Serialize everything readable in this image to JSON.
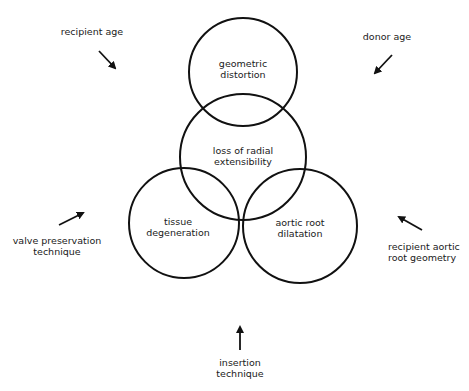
{
  "circles": {
    "top": {
      "line1": "geometric",
      "line2": "distortion"
    },
    "middle": {
      "line1": "loss of radial",
      "line2": "extensibility"
    },
    "left": {
      "line1": "tissue",
      "line2": "degeneration"
    },
    "right": {
      "line1": "aortic root",
      "line2": "dilatation"
    }
  },
  "factors": {
    "top_left": {
      "line1": "recipient age"
    },
    "top_right": {
      "line1": "donor age"
    },
    "left": {
      "line1": "valve preservation",
      "line2": "technique"
    },
    "right": {
      "line1": "recipient aortic",
      "line2": "root geometry"
    },
    "bottom": {
      "line1": "insertion",
      "line2": "technique"
    }
  },
  "colors": {
    "stroke": "#111111",
    "background": "#ffffff"
  }
}
